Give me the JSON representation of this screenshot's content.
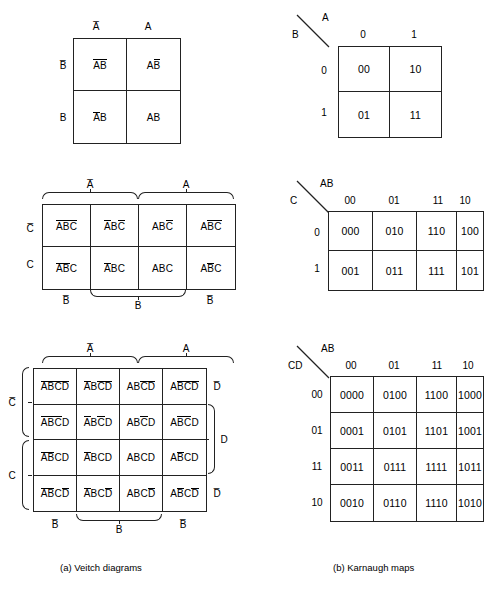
{
  "captions": {
    "a": "(a)   Veitch diagrams",
    "b": "(b)   Karnaugh maps"
  },
  "veitch2": {
    "col_labels": [
      "A̅",
      "A"
    ],
    "row_labels": [
      "B̅",
      "B"
    ],
    "cells": [
      [
        {
          "vars": "AB",
          "bars": [
            1,
            1
          ]
        },
        {
          "vars": "AB",
          "bars": [
            0,
            1
          ]
        }
      ],
      [
        {
          "vars": "AB",
          "bars": [
            1,
            0
          ]
        },
        {
          "vars": "AB",
          "bars": [
            0,
            0
          ]
        }
      ]
    ],
    "cells_text": [
      [
        "A̅B̅",
        "AB̅"
      ],
      [
        "A̅B",
        "AB"
      ]
    ]
  },
  "veitch3": {
    "top_braces": [
      "A̅",
      "A"
    ],
    "row_labels": [
      "C̅",
      "C"
    ],
    "bottom_labels": [
      "B̅",
      "B",
      "B̅"
    ],
    "cells": [
      [
        {
          "vars": "ABC",
          "bars": [
            1,
            1,
            1
          ]
        },
        {
          "vars": "ABC",
          "bars": [
            1,
            0,
            1
          ]
        },
        {
          "vars": "ABC",
          "bars": [
            0,
            0,
            1
          ]
        },
        {
          "vars": "ABC",
          "bars": [
            0,
            1,
            1
          ]
        }
      ],
      [
        {
          "vars": "ABC",
          "bars": [
            1,
            1,
            0
          ]
        },
        {
          "vars": "ABC",
          "bars": [
            1,
            0,
            0
          ]
        },
        {
          "vars": "ABC",
          "bars": [
            0,
            0,
            0
          ]
        },
        {
          "vars": "ABC",
          "bars": [
            0,
            1,
            0
          ]
        }
      ]
    ],
    "cells_text": [
      [
        "A̅B̅C̅",
        "A̅BC̅",
        "ABC̅",
        "AB̅C̅"
      ],
      [
        "A̅B̅C",
        "A̅BC",
        "ABC",
        "AB̅C"
      ]
    ]
  },
  "veitch4": {
    "top_braces": [
      "A̅",
      "A"
    ],
    "left_braces": [
      "C̅",
      "C"
    ],
    "right_labels": [
      "D̅",
      "D",
      "D̅"
    ],
    "bottom_labels": [
      "B̅",
      "B",
      "B̅"
    ],
    "cells": [
      [
        {
          "vars": "ABCD",
          "bars": [
            1,
            1,
            1,
            1
          ]
        },
        {
          "vars": "ABCD",
          "bars": [
            1,
            0,
            1,
            1
          ]
        },
        {
          "vars": "ABCD",
          "bars": [
            0,
            0,
            1,
            1
          ]
        },
        {
          "vars": "ABCD",
          "bars": [
            0,
            1,
            1,
            1
          ]
        }
      ],
      [
        {
          "vars": "ABCD",
          "bars": [
            1,
            1,
            1,
            0
          ]
        },
        {
          "vars": "ABCD",
          "bars": [
            1,
            0,
            1,
            0
          ]
        },
        {
          "vars": "ABCD",
          "bars": [
            0,
            0,
            1,
            0
          ]
        },
        {
          "vars": "ABCD",
          "bars": [
            0,
            1,
            1,
            0
          ]
        }
      ],
      [
        {
          "vars": "ABCD",
          "bars": [
            1,
            1,
            0,
            0
          ]
        },
        {
          "vars": "ABCD",
          "bars": [
            1,
            0,
            0,
            0
          ]
        },
        {
          "vars": "ABCD",
          "bars": [
            0,
            0,
            0,
            0
          ]
        },
        {
          "vars": "ABCD",
          "bars": [
            0,
            1,
            0,
            0
          ]
        }
      ],
      [
        {
          "vars": "ABCD",
          "bars": [
            1,
            1,
            0,
            1
          ]
        },
        {
          "vars": "ABCD",
          "bars": [
            1,
            0,
            0,
            1
          ]
        },
        {
          "vars": "ABCD",
          "bars": [
            0,
            0,
            0,
            1
          ]
        },
        {
          "vars": "ABCD",
          "bars": [
            0,
            1,
            0,
            1
          ]
        }
      ]
    ],
    "cells_text": [
      [
        "A̅B̅C̅D̅",
        "A̅BC̅D̅",
        "ABC̅D̅",
        "AB̅C̅D̅"
      ],
      [
        "A̅B̅C̅D",
        "A̅BC̅D",
        "ABC̅D",
        "AB̅C̅D"
      ],
      [
        "A̅B̅CD",
        "A̅BCD",
        "ABCD",
        "AB̅CD"
      ],
      [
        "A̅B̅CD̅",
        "A̅BCD̅",
        "ABCD̅",
        "AB̅CD̅"
      ]
    ]
  },
  "karnaugh2": {
    "corner_top": "A",
    "corner_bottom": "B",
    "col_headers": [
      "0",
      "1"
    ],
    "row_headers": [
      "0",
      "1"
    ],
    "cells": [
      [
        "00",
        "10"
      ],
      [
        "01",
        "11"
      ]
    ]
  },
  "karnaugh3": {
    "corner_top": "AB",
    "corner_bottom": "C",
    "col_headers": [
      "00",
      "01",
      "11",
      "10"
    ],
    "row_headers": [
      "0",
      "1"
    ],
    "cells": [
      [
        "000",
        "010",
        "110",
        "100"
      ],
      [
        "001",
        "011",
        "111",
        "101"
      ]
    ]
  },
  "karnaugh4": {
    "corner_top": "AB",
    "corner_bottom": "CD",
    "col_headers": [
      "00",
      "01",
      "11",
      "10"
    ],
    "row_headers": [
      "00",
      "01",
      "11",
      "10"
    ],
    "cells": [
      [
        "0000",
        "0100",
        "1100",
        "1000"
      ],
      [
        "0001",
        "0101",
        "1101",
        "1001"
      ],
      [
        "0011",
        "0111",
        "1111",
        "1011"
      ],
      [
        "0010",
        "0110",
        "1110",
        "1010"
      ]
    ]
  }
}
